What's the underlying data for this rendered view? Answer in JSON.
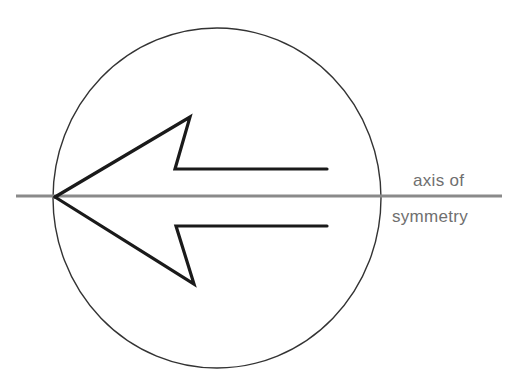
{
  "diagram": {
    "title": "",
    "labels": {
      "axis_line1": "axis of",
      "axis_line2": "symmetry"
    },
    "colors": {
      "background": "#ffffff",
      "circle": "#333333",
      "arrow": "#1a1a1a",
      "axis": "#8a8a8a",
      "label": "#6f6f6f"
    },
    "circle": {
      "cx": 217,
      "cy": 198,
      "rx": 164,
      "ry": 170
    },
    "axis": {
      "x1": 16,
      "y1": 196,
      "x2": 502,
      "y2": 196
    },
    "arrow": {
      "direction": "left",
      "tip": [
        55,
        197
      ],
      "upper_barb": [
        190,
        117
      ],
      "upper_inner": [
        175,
        169
      ],
      "upper_shaft_end": [
        327,
        169
      ],
      "lower_barb": [
        194,
        284
      ],
      "lower_inner": [
        176,
        226
      ],
      "lower_shaft_end": [
        327,
        226
      ]
    }
  }
}
